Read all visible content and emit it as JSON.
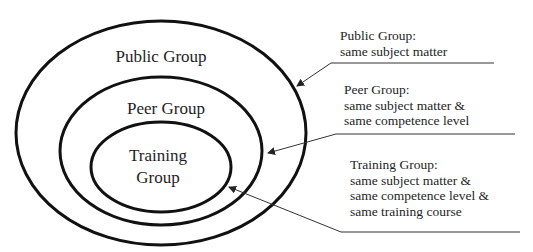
{
  "diagram": {
    "type": "nested-ellipses",
    "colors": {
      "stroke": "#111111",
      "leader": "#333333",
      "text": "#1e1e1e",
      "background": "#ffffff"
    },
    "groups": [
      {
        "id": "public",
        "label_lines": [
          "Public Group"
        ],
        "note_title": "Public Group:",
        "note_lines": [
          "same subject matter"
        ]
      },
      {
        "id": "peer",
        "label_lines": [
          "Peer Group"
        ],
        "note_title": "Peer Group:",
        "note_lines": [
          "same subject matter &",
          "same competence level"
        ]
      },
      {
        "id": "training",
        "label_lines": [
          "Training",
          "Group"
        ],
        "note_title": "Training Group:",
        "note_lines": [
          "same subject matter &",
          "same competence level &",
          "same training course"
        ]
      }
    ]
  }
}
